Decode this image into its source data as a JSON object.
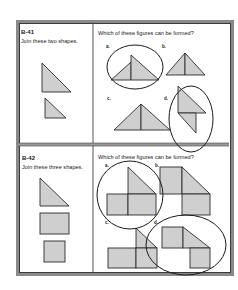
{
  "problems": [
    {
      "id": "B-41",
      "instruction": "Join these two shapes.",
      "question": "Which of these figures can be formed?",
      "options": [
        {
          "label": "a.",
          "circled": true
        },
        {
          "label": "b.",
          "circled": false
        },
        {
          "label": "c.",
          "circled": false
        },
        {
          "label": "d.",
          "circled": true
        }
      ]
    },
    {
      "id": "B-42",
      "instruction": "Join these three shapes.",
      "question": "Which of these figures can be formed?",
      "options": [
        {
          "label": "a.",
          "circled": true
        },
        {
          "label": "b.",
          "circled": false
        },
        {
          "label": "c.",
          "circled": false
        },
        {
          "label": "d.",
          "circled": true
        }
      ]
    }
  ],
  "colors": {
    "shape_fill": "#cfcfcf",
    "stroke": "#2a2a2a",
    "frame": "#8a8a8a"
  }
}
